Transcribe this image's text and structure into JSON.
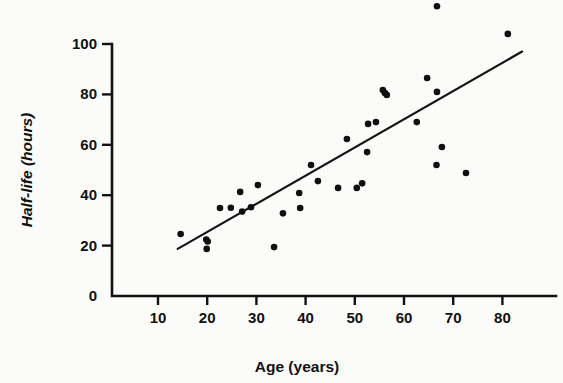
{
  "chart_data": {
    "type": "scatter",
    "title": "",
    "xlabel": "Age (years)",
    "ylabel": "Half-life (hours)",
    "xlim": [
      4,
      87
    ],
    "ylim": [
      0,
      112
    ],
    "xticks": [
      10,
      20,
      30,
      40,
      50,
      60,
      70,
      80
    ],
    "yticks": [
      0,
      20,
      40,
      60,
      80,
      100
    ],
    "xtick_labels": [
      "10",
      "20",
      "30",
      "40",
      "50",
      "60",
      "70",
      "80"
    ],
    "ytick_labels": [
      "0",
      "20",
      "40",
      "60",
      "80",
      "100"
    ],
    "grid": false,
    "legend": "none",
    "marker": "filled-circle",
    "marker_color": "#101010",
    "line_color": "#151515",
    "points": [
      {
        "x": 14.6,
        "y": 24.6
      },
      {
        "x": 19.8,
        "y": 22.4
      },
      {
        "x": 20.1,
        "y": 21.6
      },
      {
        "x": 19.9,
        "y": 18.7
      },
      {
        "x": 22.6,
        "y": 34.9
      },
      {
        "x": 24.8,
        "y": 35.0
      },
      {
        "x": 26.7,
        "y": 41.3
      },
      {
        "x": 27.1,
        "y": 33.5
      },
      {
        "x": 28.9,
        "y": 35.2
      },
      {
        "x": 30.3,
        "y": 44.0
      },
      {
        "x": 33.6,
        "y": 19.4
      },
      {
        "x": 35.4,
        "y": 32.8
      },
      {
        "x": 38.7,
        "y": 40.9
      },
      {
        "x": 38.9,
        "y": 34.9
      },
      {
        "x": 41.1,
        "y": 52.0
      },
      {
        "x": 42.5,
        "y": 45.6
      },
      {
        "x": 46.6,
        "y": 42.9
      },
      {
        "x": 48.4,
        "y": 62.3
      },
      {
        "x": 50.4,
        "y": 42.9
      },
      {
        "x": 51.5,
        "y": 44.7
      },
      {
        "x": 52.5,
        "y": 57.1
      },
      {
        "x": 52.7,
        "y": 68.3
      },
      {
        "x": 54.3,
        "y": 69.0
      },
      {
        "x": 55.7,
        "y": 81.7
      },
      {
        "x": 56.1,
        "y": 80.6
      },
      {
        "x": 56.5,
        "y": 79.8
      },
      {
        "x": 62.6,
        "y": 69.0
      },
      {
        "x": 64.7,
        "y": 86.5
      },
      {
        "x": 66.7,
        "y": 115.0
      },
      {
        "x": 66.7,
        "y": 81.0
      },
      {
        "x": 66.6,
        "y": 52.0
      },
      {
        "x": 67.7,
        "y": 59.1
      },
      {
        "x": 72.6,
        "y": 48.8
      },
      {
        "x": 81.1,
        "y": 104.0
      }
    ],
    "fit_line": {
      "label": "regression line",
      "x_start": 14.0,
      "y_start": 18.7,
      "x_end": 84.0,
      "y_end": 97.0
    }
  }
}
